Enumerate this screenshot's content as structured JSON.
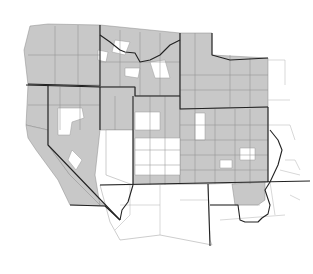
{
  "map": {
    "type": "choropleth",
    "region": "Western United States counties",
    "colors": {
      "shaded": "#c8c8c8",
      "unshaded": "#ffffff",
      "state_border": "#222222",
      "county_border": "#8c8c8c"
    },
    "states": [
      {
        "id": "WA",
        "shading": "mostly-shaded"
      },
      {
        "id": "OR",
        "shading": "mostly-shaded"
      },
      {
        "id": "ID",
        "shading": "mixed"
      },
      {
        "id": "MT",
        "shading": "mostly-shaded"
      },
      {
        "id": "WY",
        "shading": "mostly-shaded"
      },
      {
        "id": "ND",
        "shading": "shaded"
      },
      {
        "id": "SD",
        "shading": "shaded"
      },
      {
        "id": "CA",
        "shading": "mixed"
      },
      {
        "id": "NV",
        "shading": "mixed"
      },
      {
        "id": "UT",
        "shading": "mixed"
      },
      {
        "id": "CO",
        "shading": "mostly-shaded"
      },
      {
        "id": "NE",
        "shading": "mixed"
      },
      {
        "id": "AZ",
        "shading": "unshaded"
      },
      {
        "id": "NM",
        "shading": "unshaded"
      },
      {
        "id": "TX",
        "shading": "mixed"
      },
      {
        "id": "OK",
        "shading": "mixed"
      }
    ]
  }
}
